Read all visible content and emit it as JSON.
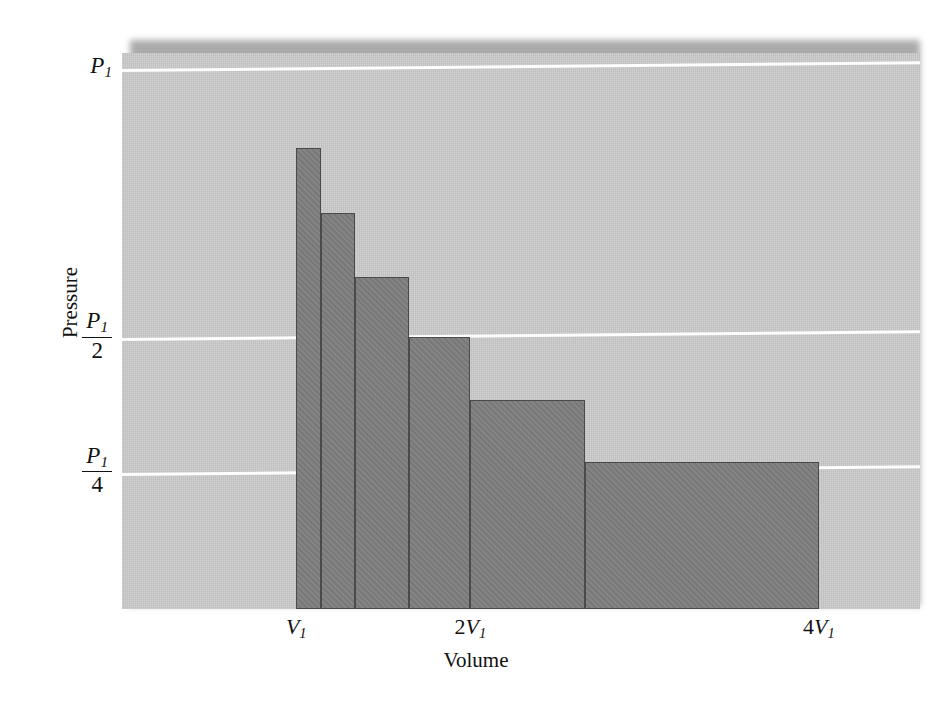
{
  "figure": {
    "title": "",
    "background_color": "#ffffff",
    "panel_color": "#c9c9c9",
    "bar_color": "#7d7d7d",
    "bar_edge_color": "#4a4a4a",
    "gridline_color": "#fdfdfd"
  },
  "axes": {
    "y_axis_label": "Pressure",
    "x_axis_label": "Volume",
    "y_ticks": [
      {
        "label": "P1",
        "base": "P",
        "sub": "1",
        "kind": "plain",
        "numerator": "",
        "denominator": "",
        "value": 1
      },
      {
        "label": "P1/2",
        "base": "P",
        "sub": "1",
        "kind": "fraction",
        "numerator": "P1",
        "denominator": "2",
        "value": 0.5
      },
      {
        "label": "P1/4",
        "base": "P",
        "sub": "1",
        "kind": "fraction",
        "numerator": "P1",
        "denominator": "4",
        "value": 0.25
      }
    ],
    "x_ticks": [
      {
        "label": "V1",
        "base": "V",
        "coefficient": "",
        "sub": "1",
        "value": 1
      },
      {
        "label": "2V1",
        "base": "V",
        "coefficient": "2",
        "sub": "1",
        "value": 2
      },
      {
        "label": "4V1",
        "base": "V",
        "coefficient": "4",
        "sub": "1",
        "value": 4
      }
    ]
  },
  "chart_data": {
    "type": "bar",
    "title": "",
    "subtitle": "",
    "xlabel": "Volume",
    "ylabel": "Pressure",
    "xlim": [
      0.0,
      4.58
    ],
    "ylim": [
      0.0,
      1.105
    ],
    "grid": true,
    "gridlines_y": [
      1,
      0.5,
      0.25
    ],
    "legend": "none",
    "x_tick_labels": [
      "V1",
      "2V1",
      "4V1"
    ],
    "x_tick_values": [
      1,
      2,
      4
    ],
    "y_tick_labels": [
      "P1",
      "P1/2",
      "P1/4"
    ],
    "y_tick_values": [
      1,
      0.5,
      0.25
    ],
    "bars": [
      {
        "index": 1,
        "x_left": 1.0,
        "x_right": 1.14,
        "height": 0.855,
        "height_label": ""
      },
      {
        "index": 2,
        "x_left": 1.14,
        "x_right": 1.34,
        "height": 0.735,
        "height_label": ""
      },
      {
        "index": 3,
        "x_left": 1.34,
        "x_right": 1.65,
        "height": 0.615,
        "height_label": ""
      },
      {
        "index": 4,
        "x_left": 1.65,
        "x_right": 2.0,
        "height": 0.503,
        "height_label": ""
      },
      {
        "index": 5,
        "x_left": 2.0,
        "x_right": 2.66,
        "height": 0.387,
        "height_label": ""
      },
      {
        "index": 6,
        "x_left": 2.66,
        "x_right": 4.0,
        "height": 0.271,
        "height_label": ""
      }
    ],
    "categories": [
      "bar-1",
      "bar-2",
      "bar-3",
      "bar-4",
      "bar-5",
      "bar-6"
    ],
    "values": [
      0.855,
      0.735,
      0.615,
      0.503,
      0.387,
      0.271
    ]
  }
}
